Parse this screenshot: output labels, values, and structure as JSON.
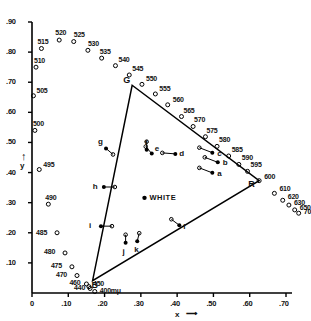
{
  "figure": {
    "type": "cie-chromaticity-diagram",
    "white_label": "WHITE",
    "x_axis_title": "x",
    "y_axis_title": "y",
    "arrow_glyph": "⟶",
    "unit_label": "700mμ"
  },
  "chart_data": {
    "type": "scatter",
    "title": "",
    "xlabel": "x",
    "ylabel": "y",
    "xlim": [
      0,
      0.78
    ],
    "ylim": [
      0,
      0.9
    ],
    "grid": false,
    "legend": "none",
    "x_ticks": [
      "0",
      ".10",
      ".20",
      ".30",
      ".40",
      ".50",
      ".60",
      ".70"
    ],
    "x_tick_values": [
      0,
      0.1,
      0.2,
      0.3,
      0.4,
      0.5,
      0.6,
      0.7
    ],
    "y_ticks": [
      ".10",
      ".20",
      ".30",
      ".40",
      ".50",
      ".60",
      ".70",
      ".80",
      ".90"
    ],
    "y_tick_values": [
      0.1,
      0.2,
      0.3,
      0.4,
      0.5,
      0.6,
      0.7,
      0.8,
      0.9
    ],
    "series": [
      {
        "name": "spectral-locus",
        "marker": "open-circle",
        "points": [
          {
            "label": "400mμ",
            "x": 0.173,
            "y": 0.005
          },
          {
            "label": "440",
            "x": 0.16,
            "y": 0.015
          },
          {
            "label": "450",
            "x": 0.157,
            "y": 0.021
          },
          {
            "label": "460",
            "x": 0.15,
            "y": 0.03
          },
          {
            "label": "470",
            "x": 0.124,
            "y": 0.058
          },
          {
            "label": "475",
            "x": 0.11,
            "y": 0.087
          },
          {
            "label": "480",
            "x": 0.091,
            "y": 0.133
          },
          {
            "label": "485",
            "x": 0.069,
            "y": 0.2
          },
          {
            "label": "490",
            "x": 0.045,
            "y": 0.295
          },
          {
            "label": "495",
            "x": 0.02,
            "y": 0.41
          },
          {
            "label": "500",
            "x": 0.008,
            "y": 0.54
          },
          {
            "label": "505",
            "x": 0.004,
            "y": 0.655
          },
          {
            "label": "510",
            "x": 0.011,
            "y": 0.75
          },
          {
            "label": "515",
            "x": 0.026,
            "y": 0.812
          },
          {
            "label": "520",
            "x": 0.075,
            "y": 0.84
          },
          {
            "label": "525",
            "x": 0.115,
            "y": 0.835
          },
          {
            "label": "530",
            "x": 0.154,
            "y": 0.806
          },
          {
            "label": "535",
            "x": 0.192,
            "y": 0.78
          },
          {
            "label": "540",
            "x": 0.23,
            "y": 0.755
          },
          {
            "label": "545",
            "x": 0.268,
            "y": 0.724
          },
          {
            "label": "550",
            "x": 0.303,
            "y": 0.693
          },
          {
            "label": "555",
            "x": 0.34,
            "y": 0.661
          },
          {
            "label": "560",
            "x": 0.374,
            "y": 0.625
          },
          {
            "label": "565",
            "x": 0.412,
            "y": 0.586
          },
          {
            "label": "570",
            "x": 0.444,
            "y": 0.553
          },
          {
            "label": "575",
            "x": 0.478,
            "y": 0.519
          },
          {
            "label": "580",
            "x": 0.51,
            "y": 0.487
          },
          {
            "label": "585",
            "x": 0.542,
            "y": 0.455
          },
          {
            "label": "590",
            "x": 0.57,
            "y": 0.427
          },
          {
            "label": "595",
            "x": 0.594,
            "y": 0.404
          },
          {
            "label": "600",
            "x": 0.626,
            "y": 0.373
          },
          {
            "label": "610",
            "x": 0.668,
            "y": 0.331
          },
          {
            "label": "620",
            "x": 0.691,
            "y": 0.308
          },
          {
            "label": "630",
            "x": 0.708,
            "y": 0.292
          },
          {
            "label": "650",
            "x": 0.724,
            "y": 0.276
          },
          {
            "label": "700mμ",
            "x": 0.735,
            "y": 0.265
          }
        ]
      },
      {
        "name": "sample-points",
        "marker": "filled-circle-with-arrow",
        "points": [
          {
            "label": "a",
            "x": 0.497,
            "y": 0.399
          },
          {
            "label": "b",
            "x": 0.512,
            "y": 0.434
          },
          {
            "label": "c",
            "x": 0.497,
            "y": 0.466
          },
          {
            "label": "d",
            "x": 0.395,
            "y": 0.462
          },
          {
            "label": "e",
            "x": 0.33,
            "y": 0.463
          },
          {
            "label": "f",
            "x": 0.316,
            "y": 0.476
          },
          {
            "label": "g",
            "x": 0.204,
            "y": 0.48
          },
          {
            "label": "h",
            "x": 0.198,
            "y": 0.352
          },
          {
            "label": "i",
            "x": 0.19,
            "y": 0.222
          },
          {
            "label": "j",
            "x": 0.258,
            "y": 0.167
          },
          {
            "label": "k",
            "x": 0.29,
            "y": 0.172
          },
          {
            "label": "l",
            "x": 0.406,
            "y": 0.225
          }
        ]
      },
      {
        "name": "white-point",
        "marker": "filled-circle",
        "points": [
          {
            "label": "WHITE",
            "x": 0.31,
            "y": 0.316
          }
        ]
      },
      {
        "name": "gamut-triangle",
        "marker": "line",
        "points": [
          {
            "label": "G",
            "x": 0.276,
            "y": 0.69
          },
          {
            "label": "R",
            "x": 0.626,
            "y": 0.373
          },
          {
            "label": "B",
            "x": 0.167,
            "y": 0.041
          }
        ]
      }
    ]
  }
}
